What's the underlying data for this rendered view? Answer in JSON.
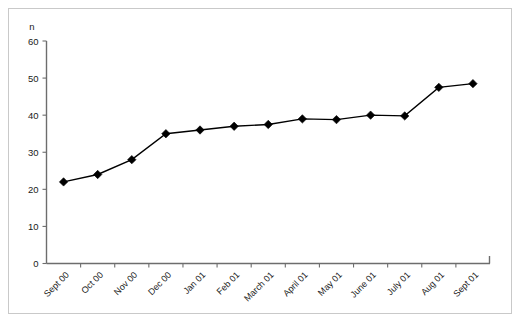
{
  "chart_data": {
    "type": "line",
    "title": "",
    "subtitle": "",
    "xlabel": "",
    "ylabel": "n",
    "ylim": [
      0,
      60
    ],
    "yticks": [
      0,
      10,
      20,
      30,
      40,
      50,
      60
    ],
    "ytick_labels": [
      "0",
      "10",
      "20",
      "30",
      "40",
      "50",
      "60"
    ],
    "grid": false,
    "legend": false,
    "legend_position": "none",
    "marker": "diamond",
    "line_color": "#000000",
    "marker_color": "#000000",
    "categories": [
      "Sept 00",
      "Oct 00",
      "Nov 00",
      "Dec 00",
      "Jan 01",
      "Feb 01",
      "March 01",
      "April 01",
      "May 01",
      "June 01",
      "July 01",
      "Aug 01",
      "Sept 01"
    ],
    "values": [
      22,
      24,
      28,
      35,
      36,
      37,
      37.5,
      39,
      38.8,
      40,
      39.8,
      47.5,
      48.5
    ],
    "xtick_rotation": -45
  },
  "frame": {
    "border_color": "#c9c9c9",
    "background": "#ffffff"
  }
}
